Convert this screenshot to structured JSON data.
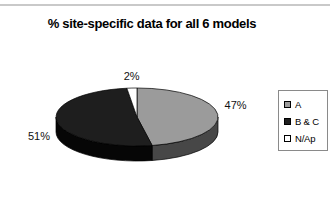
{
  "chart_data": {
    "type": "pie",
    "title": "% site-specific data for all 6 models",
    "categories": [
      "A",
      "B & C",
      "N/Ap"
    ],
    "values": [
      47,
      51,
      2
    ],
    "slices": [
      {
        "label": "A",
        "value": 47,
        "pct_label": "47%",
        "color": "#9b9b9b",
        "side_color": "#474747"
      },
      {
        "label": "B & C",
        "value": 51,
        "pct_label": "51%",
        "color": "#1e1e1e",
        "side_color": "#060606"
      },
      {
        "label": "N/Ap",
        "value": 2,
        "pct_label": "2%",
        "color": "#ffffff",
        "side_color": "#f0f0f0"
      }
    ],
    "legend": {
      "position": "right",
      "entries": [
        "A",
        "B & C",
        "N/Ap"
      ]
    },
    "start_angle_deg": 90,
    "direction": "clockwise",
    "style_3d": true,
    "outline_color": "#000000",
    "background": "#ffffff"
  }
}
